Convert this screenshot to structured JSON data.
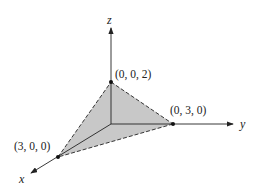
{
  "diagram": {
    "type": "3d-coordinate-plane-triangle",
    "axes": {
      "x": {
        "label": "x"
      },
      "y": {
        "label": "y"
      },
      "z": {
        "label": "z"
      }
    },
    "points": [
      {
        "id": "z-intercept",
        "label": "(0, 0, 2)"
      },
      {
        "id": "y-intercept",
        "label": "(0, 3, 0)"
      },
      {
        "id": "x-intercept",
        "label": "(3, 0, 0)"
      }
    ],
    "colors": {
      "fill": "#c8c8c8",
      "stroke": "#222222"
    }
  }
}
